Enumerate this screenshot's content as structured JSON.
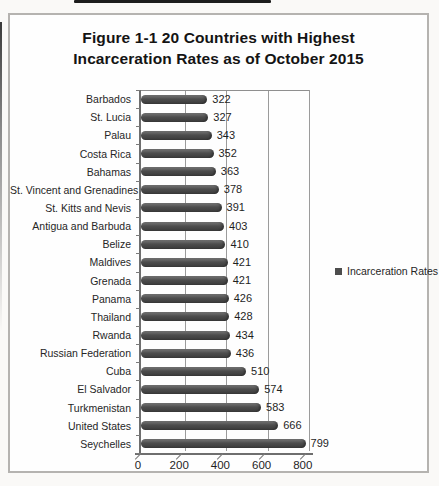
{
  "chart": {
    "title_line1": "Figure 1-1 20 Countries with Highest",
    "title_line2": "Incarceration Rates as of October 2015"
  },
  "chart_data": {
    "type": "bar",
    "orientation": "horizontal",
    "title": "Figure 1-1 20 Countries with Highest Incarceration Rates as of October 2015",
    "categories": [
      "Barbados",
      "St. Lucia",
      "Palau",
      "Costa Rica",
      "Bahamas",
      "St. Vincent and Grenadines",
      "St. Kitts and Nevis",
      "Antigua and Barbuda",
      "Belize",
      "Maldives",
      "Grenada",
      "Panama",
      "Thailand",
      "Rwanda",
      "Russian Federation",
      "Cuba",
      "El Salvador",
      "Turkmenistan",
      "United States",
      "Seychelles"
    ],
    "values": [
      322,
      327,
      343,
      352,
      363,
      378,
      391,
      403,
      410,
      421,
      421,
      426,
      428,
      434,
      436,
      510,
      574,
      583,
      666,
      799
    ],
    "series": [
      {
        "name": "Incarceration Rates",
        "values": [
          322,
          327,
          343,
          352,
          363,
          378,
          391,
          403,
          410,
          421,
          421,
          426,
          428,
          434,
          436,
          510,
          574,
          583,
          666,
          799
        ]
      }
    ],
    "legend": {
      "label": "Incarceration Rates",
      "position": "right"
    },
    "x_ticks": [
      0,
      200,
      400,
      600,
      800
    ],
    "xlim": [
      0,
      800
    ],
    "grid": true,
    "bar_color": "#4d4d4d",
    "style": "3d-cylinder",
    "data_labels": true
  }
}
